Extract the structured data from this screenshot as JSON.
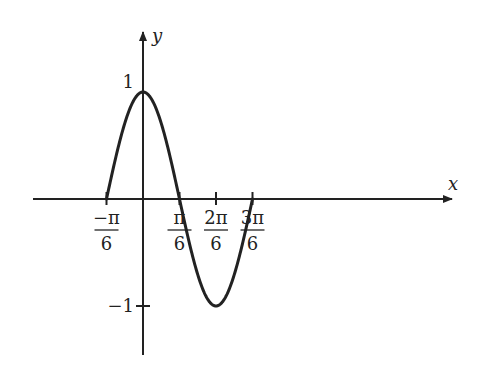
{
  "chart_data": {
    "type": "line",
    "title": "",
    "function": "y = cos(3x)",
    "xlabel": "x",
    "ylabel": "y",
    "xlim": [
      -0.5236,
      1.5708
    ],
    "ylim": [
      -1,
      1
    ],
    "grid": false,
    "legend": null,
    "x_ticks": [
      {
        "value": -0.5236,
        "num": "−π",
        "den": "6"
      },
      {
        "value": 0.5236,
        "num": "π",
        "den": "6"
      },
      {
        "value": 1.0472,
        "num": "2π",
        "den": "6"
      },
      {
        "value": 1.5708,
        "num": "3π",
        "den": "6"
      }
    ],
    "y_ticks": [
      {
        "value": 1,
        "label": "1"
      },
      {
        "value": -1,
        "label": "−1"
      }
    ],
    "series": [
      {
        "name": "cos(3x)",
        "x": [
          -0.5236,
          -0.2618,
          0,
          0.2618,
          0.5236,
          0.7854,
          1.0472,
          1.309,
          1.5708
        ],
        "y": [
          0,
          0.7071,
          1,
          0.7071,
          0,
          -0.7071,
          -1,
          -0.7071,
          0
        ]
      }
    ],
    "color": "#222222"
  },
  "axes": {
    "x_label": "x",
    "y_label": "y"
  }
}
